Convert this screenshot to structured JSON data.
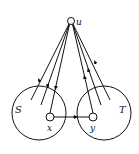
{
  "diagram": {
    "nodes": {
      "u": {
        "label": "u"
      },
      "x": {
        "label": "x"
      },
      "y": {
        "label": "y"
      }
    },
    "sets": {
      "S": {
        "label": "S"
      },
      "T": {
        "label": "T"
      }
    },
    "edges": [
      {
        "from": "u",
        "to": "S",
        "direction": "to_u"
      },
      {
        "from": "u",
        "to": "S",
        "direction": "to_S"
      },
      {
        "from": "u",
        "to": "x",
        "direction": "to_x"
      },
      {
        "from": "x",
        "to": "y",
        "direction": "to_y"
      },
      {
        "from": "y",
        "to": "u",
        "direction": "to_u"
      },
      {
        "from": "T",
        "to": "u",
        "direction": "to_u"
      },
      {
        "from": "T",
        "to": "u",
        "direction": "to_u"
      }
    ]
  }
}
